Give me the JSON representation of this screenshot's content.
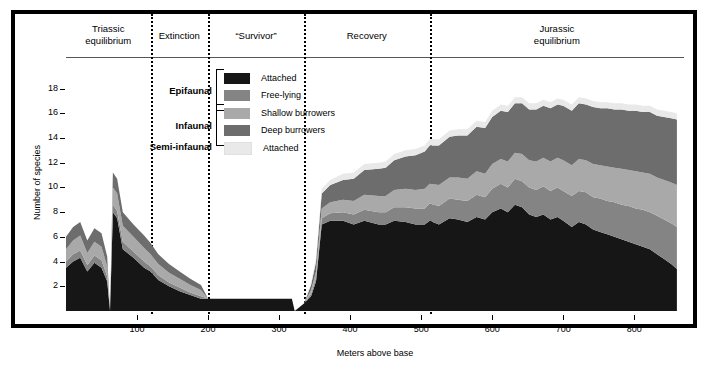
{
  "figure": {
    "xlabel": "Meters above base",
    "ylabel": "Number of species"
  },
  "phases": [
    {
      "label": "Triassic\nequilibrium",
      "start": 0,
      "end": 119
    },
    {
      "label": "Extinction",
      "start": 119,
      "end": 200
    },
    {
      "label": "“Survivor”",
      "start": 200,
      "end": 335
    },
    {
      "label": "Recovery",
      "start": 335,
      "end": 512
    },
    {
      "label": "Jurassic\nequilibrium",
      "start": 512,
      "end": 870
    }
  ],
  "phase_labels": [
    "Triassic equilibrium",
    "Extinction",
    "“Survivor”",
    "Recovery",
    "Jurassic equilibrium"
  ],
  "legend": {
    "groups": [
      {
        "name": "Epifaunal",
        "entries": [
          "Attached",
          "Free-lying"
        ]
      },
      {
        "name": "Infaunal",
        "entries": [
          "Shallow burrowers",
          "Deep burrowers"
        ]
      },
      {
        "name": "Semi-infaunal",
        "entries": [
          "Attached"
        ]
      }
    ],
    "items": [
      {
        "label": "Attached",
        "color": "#161616"
      },
      {
        "label": "Free-lying",
        "color": "#848484"
      },
      {
        "label": "Shallow burrowers",
        "color": "#a9a9a9"
      },
      {
        "label": "Deep burrowers",
        "color": "#6d6d6d"
      },
      {
        "label": "Attached",
        "color": "#e9e9e9"
      }
    ]
  },
  "chart_data": {
    "type": "area",
    "title": "",
    "xlabel": "Meters above base",
    "ylabel": "Number of species",
    "xlim": [
      0,
      870
    ],
    "ylim": [
      0,
      19.5
    ],
    "xticks": [
      100,
      200,
      300,
      400,
      500,
      600,
      700,
      800
    ],
    "yticks": [
      2,
      4,
      6,
      8,
      10,
      12,
      14,
      16,
      18
    ],
    "grid": false,
    "legend_position": "top-center",
    "stack_order_bottom_to_top": [
      "Semi-infaunal attached",
      "Deep burrowers",
      "Shallow burrowers",
      "Free-lying",
      "Epifaunal attached"
    ],
    "x": [
      0,
      10,
      20,
      30,
      40,
      50,
      58,
      62,
      66,
      72,
      80,
      95,
      110,
      119,
      130,
      145,
      160,
      175,
      190,
      200,
      205,
      260,
      300,
      318,
      322,
      335,
      345,
      352,
      360,
      372,
      390,
      405,
      420,
      440,
      450,
      462,
      478,
      492,
      505,
      512,
      525,
      540,
      552,
      565,
      578,
      590,
      600,
      612,
      622,
      632,
      642,
      652,
      662,
      672,
      682,
      692,
      700,
      712,
      722,
      732,
      742,
      752,
      762,
      772,
      782,
      792,
      802,
      812,
      822,
      832,
      842,
      852,
      860
    ],
    "series": [
      {
        "name": "Epifaunal attached",
        "color": "#161616",
        "values": [
          3.5,
          4.0,
          4.3,
          3.2,
          3.9,
          3.5,
          2.4,
          0,
          8.0,
          7.5,
          5.0,
          4.3,
          3.5,
          3.2,
          2.5,
          2.0,
          1.6,
          1.3,
          1.0,
          1.0,
          1.0,
          1.0,
          1.0,
          1.0,
          0,
          0.6,
          1.2,
          2.4,
          7.0,
          7.3,
          7.3,
          7.0,
          7.3,
          7.0,
          7.0,
          7.3,
          7.2,
          7.0,
          7.0,
          7.3,
          7.0,
          7.5,
          7.4,
          7.2,
          7.6,
          7.4,
          8.0,
          8.3,
          8.0,
          8.6,
          8.4,
          7.8,
          7.6,
          7.8,
          7.4,
          7.6,
          7.3,
          6.8,
          7.2,
          7.0,
          6.6,
          6.4,
          6.2,
          6.0,
          5.8,
          5.6,
          5.4,
          5.2,
          5.0,
          4.6,
          4.2,
          3.8,
          3.4
        ]
      },
      {
        "name": "Free-lying",
        "color": "#848484",
        "values": [
          0.5,
          0.6,
          0.6,
          0.5,
          0.6,
          0.6,
          0.4,
          0,
          0.6,
          0.6,
          0.6,
          0.5,
          0.5,
          0.4,
          0.4,
          0.3,
          0.3,
          0.2,
          0.2,
          0,
          0,
          0,
          0,
          0,
          0,
          0,
          0.2,
          0.3,
          0.5,
          0.6,
          0.7,
          0.8,
          0.9,
          1.0,
          1.0,
          1.1,
          1.2,
          1.3,
          1.3,
          1.4,
          1.5,
          1.6,
          1.6,
          1.7,
          1.8,
          1.8,
          1.9,
          2.0,
          2.0,
          2.1,
          2.1,
          2.2,
          2.2,
          2.3,
          2.3,
          2.4,
          2.4,
          2.5,
          2.5,
          2.6,
          2.6,
          2.7,
          2.7,
          2.8,
          2.8,
          2.9,
          2.9,
          3.0,
          3.0,
          3.1,
          3.2,
          3.3,
          3.4
        ]
      },
      {
        "name": "Shallow burrowers",
        "color": "#a9a9a9",
        "values": [
          1.0,
          1.1,
          1.2,
          1.0,
          1.1,
          1.1,
          0.8,
          0,
          1.4,
          1.4,
          1.3,
          1.2,
          1.1,
          1.0,
          0.9,
          0.8,
          0.7,
          0.6,
          0.5,
          0,
          0,
          0,
          0,
          0,
          0,
          0,
          0.3,
          0.5,
          0.8,
          0.9,
          1.0,
          1.1,
          1.2,
          1.3,
          1.3,
          1.4,
          1.5,
          1.5,
          1.6,
          1.6,
          1.7,
          1.7,
          1.8,
          1.8,
          1.9,
          1.9,
          2.0,
          2.0,
          2.1,
          2.1,
          2.2,
          2.2,
          2.3,
          2.3,
          2.4,
          2.4,
          2.5,
          2.5,
          2.6,
          2.6,
          2.7,
          2.7,
          2.8,
          2.8,
          2.9,
          2.9,
          3.0,
          3.0,
          3.1,
          3.1,
          3.2,
          3.3,
          3.4
        ]
      },
      {
        "name": "Deep burrowers",
        "color": "#6d6d6d",
        "values": [
          1.0,
          1.1,
          1.1,
          1.0,
          1.1,
          1.1,
          0.8,
          0,
          1.2,
          1.2,
          1.1,
          1.0,
          1.0,
          0.9,
          0.8,
          0.7,
          0.6,
          0.5,
          0.4,
          0,
          0,
          0,
          0,
          0,
          0,
          0,
          0.4,
          0.8,
          1.2,
          1.4,
          1.6,
          1.8,
          2.0,
          2.2,
          2.3,
          2.4,
          2.6,
          2.8,
          3.0,
          3.1,
          3.2,
          3.3,
          3.4,
          3.5,
          3.6,
          3.7,
          3.8,
          3.9,
          4.0,
          4.0,
          4.1,
          4.1,
          4.2,
          4.2,
          4.3,
          4.3,
          4.4,
          4.4,
          4.5,
          4.5,
          4.6,
          4.6,
          4.7,
          4.7,
          4.8,
          4.8,
          4.9,
          4.9,
          5.0,
          5.0,
          5.1,
          5.2,
          5.3
        ]
      },
      {
        "name": "Semi-infaunal attached",
        "color": "#e9e9e9",
        "values": [
          0,
          0,
          0,
          0,
          0,
          0,
          0,
          0,
          0,
          0,
          0,
          0,
          0,
          0,
          0,
          0,
          0,
          0,
          0,
          0,
          0,
          0,
          0,
          0,
          0,
          0,
          0.2,
          0.3,
          0.4,
          0.4,
          0.5,
          0.5,
          0.5,
          0.5,
          0.5,
          0.5,
          0.5,
          0.5,
          0.5,
          0.5,
          0.5,
          0.5,
          0.5,
          0.5,
          0.5,
          0.5,
          0.5,
          0.5,
          0.5,
          0.5,
          0.5,
          0.5,
          0.5,
          0.5,
          0.5,
          0.5,
          0.5,
          0.5,
          0.5,
          0.5,
          0.5,
          0.5,
          0.5,
          0.5,
          0.5,
          0.5,
          0.5,
          0.5,
          0.5,
          0.5,
          0.5,
          0.5,
          0.5
        ]
      }
    ]
  }
}
